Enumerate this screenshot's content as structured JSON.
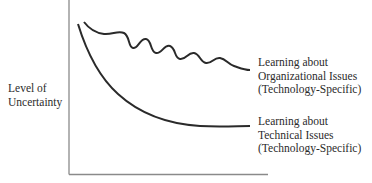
{
  "diagram": {
    "y_axis_label": [
      "Level of",
      "Uncertainty"
    ],
    "x_axis_label": "",
    "curves": [
      {
        "id": "organizational",
        "style": "wavy, slowly declining",
        "label": [
          "Learning about",
          "Organizational Issues",
          "(Technology-Specific)"
        ]
      },
      {
        "id": "technical",
        "style": "smooth, steep decline then flattening",
        "label": [
          "Learning about",
          "Technical Issues",
          "(Technology-Specific)"
        ]
      }
    ],
    "colors": {
      "axis": "#8a8a8a",
      "curve": "#2a2a2a",
      "text": "#2b2b2b"
    }
  }
}
